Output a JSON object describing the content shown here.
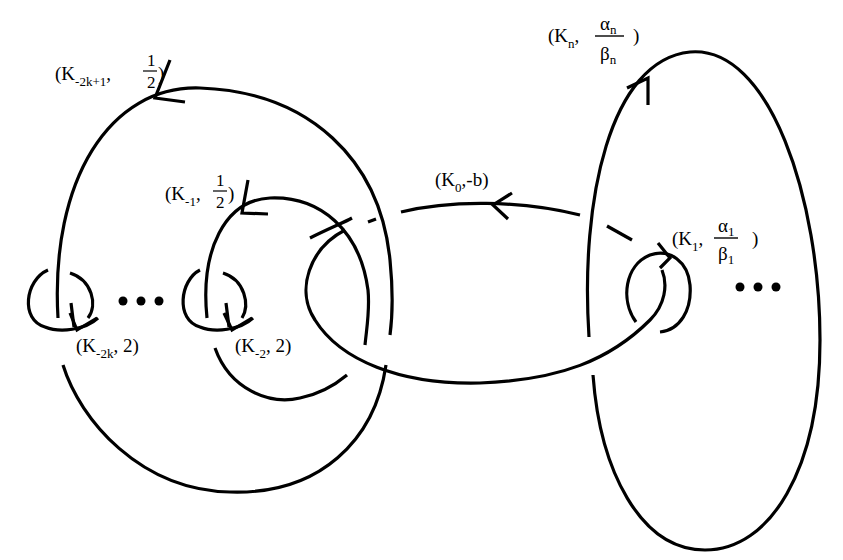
{
  "figure": {
    "components": [
      {
        "id": "K_-2k+1",
        "knot": "K",
        "sub": "-2k+1",
        "coef_num": "1",
        "coef_den": "2",
        "coef_display": "1/2"
      },
      {
        "id": "K_-1",
        "knot": "K",
        "sub": "-1",
        "coef_num": "1",
        "coef_den": "2",
        "coef_display": "1/2"
      },
      {
        "id": "K_-2k",
        "knot": "K",
        "sub": "-2k",
        "coef": "2"
      },
      {
        "id": "K_-2",
        "knot": "K",
        "sub": "-2",
        "coef": "2"
      },
      {
        "id": "K_0",
        "knot": "K",
        "sub": "0",
        "coef": "-b"
      },
      {
        "id": "K_1",
        "knot": "K",
        "sub": "1",
        "coef_num": "α",
        "coef_num_sub": "1",
        "coef_den": "β",
        "coef_den_sub": "1"
      },
      {
        "id": "K_n",
        "knot": "K",
        "sub": "n",
        "coef_num": "α",
        "coef_num_sub": "n",
        "coef_den": "β",
        "coef_den_sub": "n"
      }
    ],
    "ellipsis": "•••"
  },
  "labels": {
    "open": "(",
    "close": ")",
    "comma": ",",
    "k2k1": {
      "K": "K",
      "sub": "-2k+1",
      "num": "1",
      "den": "2"
    },
    "k1neg": {
      "K": "K",
      "sub": "-1",
      "num": "1",
      "den": "2"
    },
    "k2k": {
      "K": "K",
      "sub": "-2k",
      "coef": " 2)"
    },
    "k2": {
      "K": "K",
      "sub": "-2",
      "coef": " 2)"
    },
    "k0": {
      "K": "K",
      "sub": "0",
      "coef": "-b)"
    },
    "k1": {
      "K": "K",
      "sub": "1",
      "num": "α",
      "num_sub": "1",
      "den": "β",
      "den_sub": "1"
    },
    "kn": {
      "K": "K",
      "sub": "n",
      "num": "α",
      "num_sub": "n",
      "den": "β",
      "den_sub": "n"
    }
  },
  "colors": {
    "ink": "#000000",
    "paper": "#ffffff"
  }
}
